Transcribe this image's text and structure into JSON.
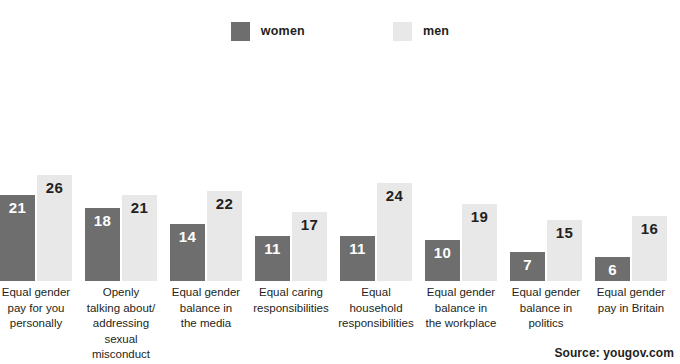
{
  "legend": {
    "entries": [
      {
        "label": "women",
        "color": "#6e6e6e",
        "swatch_name": "legend-swatch-women"
      },
      {
        "label": "men",
        "color": "#e8e8e8",
        "swatch_name": "legend-swatch-men"
      }
    ]
  },
  "source": {
    "text": "Source: yougov.com"
  },
  "chart_data": {
    "type": "bar",
    "title": "",
    "subtitle": "",
    "xlabel": "",
    "ylabel": "",
    "ylim": [
      0,
      28
    ],
    "grid": false,
    "legend_position": "top-center",
    "value_labels": true,
    "categories": [
      "Equal gender pay for you personally",
      "Openly talking about/ addressing sexual misconduct",
      "Equal gender balance in the media",
      "Equal caring responsibilities",
      "Equal household responsibilities",
      "Equal gender balance in the workplace",
      "Equal gender balance in politics",
      "Equal gender pay in Britain"
    ],
    "category_lines": [
      [
        "Equal gender",
        "pay for you",
        "personally"
      ],
      [
        "Openly",
        "talking about/",
        "addressing",
        "sexual",
        "misconduct"
      ],
      [
        "Equal gender",
        "balance in",
        "the media"
      ],
      [
        "Equal caring",
        "responsibilities"
      ],
      [
        "Equal",
        "household",
        "responsibilities"
      ],
      [
        "Equal gender",
        "balance in",
        "the workplace"
      ],
      [
        "Equal gender",
        "balance in",
        "politics"
      ],
      [
        "Equal gender",
        "pay in Britain"
      ]
    ],
    "series": [
      {
        "name": "women",
        "color": "#6e6e6e",
        "values": [
          21,
          18,
          14,
          11,
          11,
          10,
          7,
          6
        ]
      },
      {
        "name": "men",
        "color": "#e8e8e8",
        "values": [
          26,
          21,
          22,
          17,
          24,
          19,
          15,
          16
        ]
      }
    ]
  }
}
